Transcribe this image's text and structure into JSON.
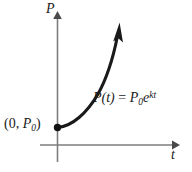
{
  "figure": {
    "background_color": "#ffffff",
    "axes": {
      "vertical": {
        "label": "P",
        "icon": "arrow-up-icon",
        "color": "#7d7d7d",
        "x": 57,
        "y_top": 12,
        "y_bottom": 162
      },
      "horizontal": {
        "label": "t",
        "icon": "arrow-right-icon",
        "color": "#7d7d7d",
        "y": 145,
        "x_left": 40,
        "x_right": 178
      }
    },
    "curve": {
      "color": "#1a1a1a",
      "stroke_width": 3,
      "start_point_label_prefix": "(0, ",
      "start_point_label_base": "P",
      "start_point_label_sub": "0",
      "start_point_label_suffix": ")",
      "start_dot": {
        "x": 57,
        "y": 127,
        "r": 3.6
      },
      "end_arrow_icon": "arrow-head-icon",
      "equation": {
        "function_name": "P",
        "argument": "(t)",
        "equals": " = ",
        "coefficient_base": "P",
        "coefficient_sub": "0",
        "exponential_base": "e",
        "exponent": "kt"
      }
    }
  }
}
